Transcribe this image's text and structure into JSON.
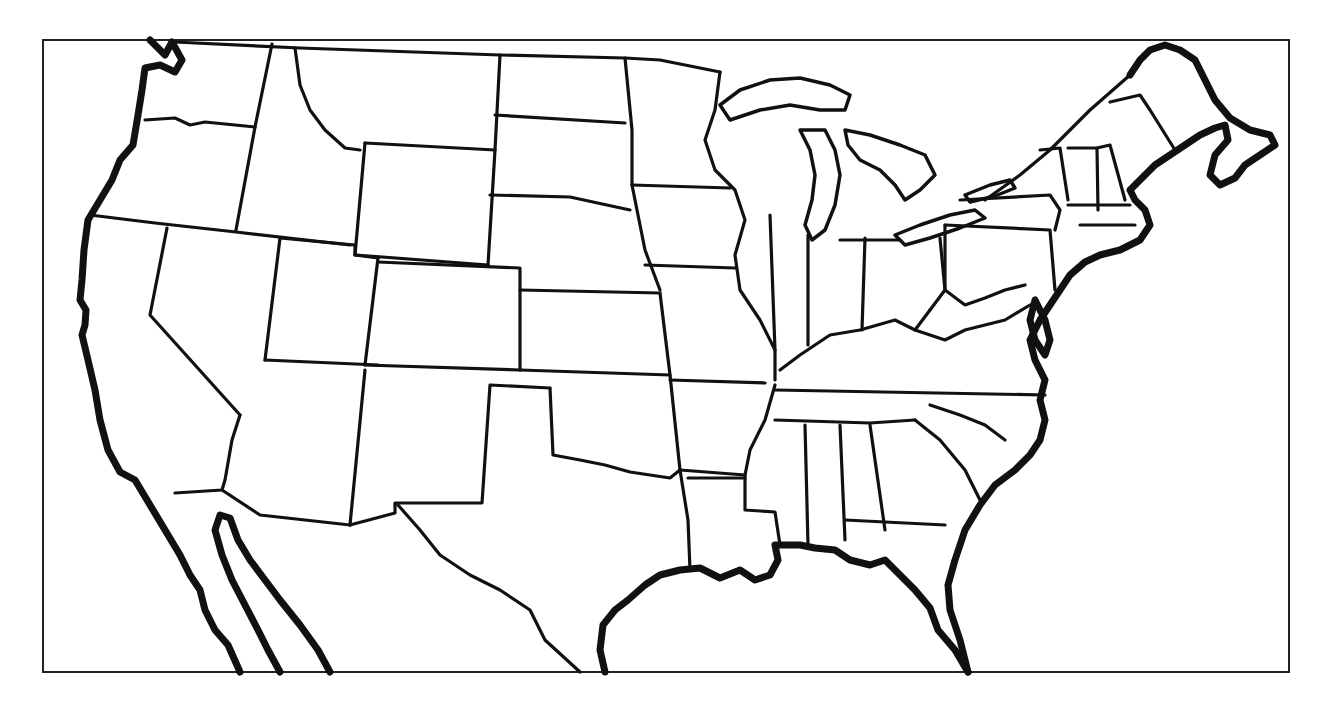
{
  "map": {
    "type": "blank outline map",
    "region": "Contiguous United States",
    "labels": [],
    "colors": {
      "background": "#ffffff",
      "lines": "#111111"
    }
  }
}
